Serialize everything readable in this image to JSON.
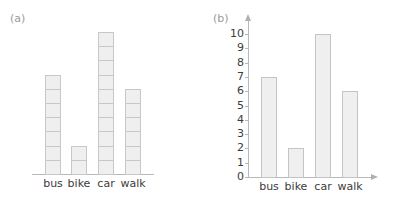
{
  "chart_data": [
    {
      "type": "bar",
      "style": "pictogram-stacked-boxes",
      "title": "(a)",
      "categories": [
        "bus",
        "bike",
        "car",
        "walk"
      ],
      "values": [
        7,
        2,
        10,
        6
      ],
      "xlabel": "",
      "ylabel": "",
      "grid": false,
      "y_axis_shown": false
    },
    {
      "type": "bar",
      "title": "(b)",
      "categories": [
        "bus",
        "bike",
        "car",
        "walk"
      ],
      "values": [
        7,
        2,
        10,
        6
      ],
      "xlabel": "",
      "ylabel": "",
      "ylim": [
        0,
        10
      ],
      "yticks": [
        "0",
        "1",
        "2",
        "3",
        "4",
        "5",
        "6",
        "7",
        "8",
        "9",
        "10"
      ],
      "grid": false,
      "y_axis_shown": true
    }
  ],
  "colors": {
    "bar_fill": "#efefef",
    "bar_border": "#c4c4c4",
    "axis": "#b8b8b8",
    "panel_label": "#9a9a9a",
    "text": "#3c3c3c"
  }
}
